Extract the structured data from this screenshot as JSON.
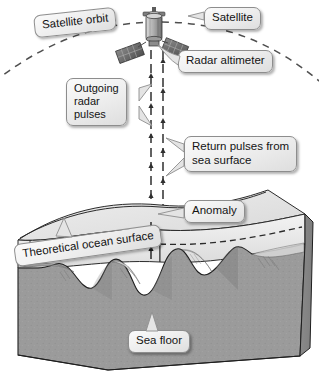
{
  "figure": {
    "background_color": "#ffffff"
  },
  "callouts": {
    "satellite_orbit": "Satellite orbit",
    "satellite": "Satellite",
    "radar_altimeter": "Radar altimeter",
    "outgoing_pulses": "Outgoing\nradar\npulses",
    "return_pulses": "Return pulses from\nsea surface",
    "anomaly": "Anomaly",
    "theoretical_ocean_surface": "Theoretical ocean surface",
    "sea_floor": "Sea floor"
  },
  "colors": {
    "callout_fill": "#ececec",
    "callout_border": "#8d8d8d",
    "text": "#141414",
    "orbit_dash": "#4a4a4a",
    "pulse_line": "#333333",
    "water_fill": "#e9e9e9",
    "seafloor_fill": "#9b9b9b",
    "block_side_fill": "#8f8f8f",
    "block_front_fill": "#9a9a9a",
    "outline": "#2b2b2b",
    "satellite_body": "#b8b8b8",
    "solar_panel": "#6d6d6d"
  },
  "elements": {
    "orbit_path_label": "dashed arc across top",
    "pulse_lines": 2,
    "satellite_solar_panels": 2
  }
}
